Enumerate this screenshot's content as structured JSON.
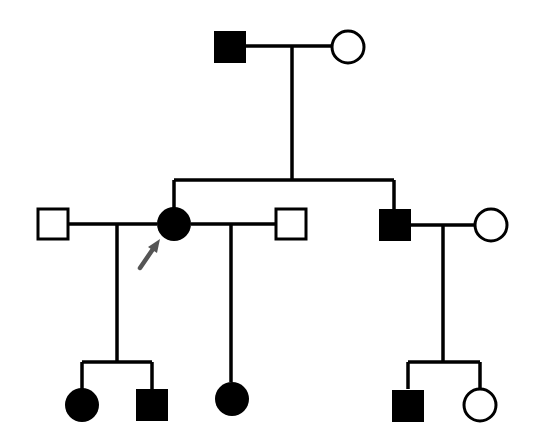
{
  "diagram": {
    "type": "pedigree",
    "colors": {
      "affected": "#000000",
      "unaffected_fill": "#ffffff",
      "line": "#000000",
      "proband_arrow": "#555555"
    },
    "generations": [
      {
        "label": "I",
        "individuals": [
          {
            "id": "I-1",
            "sex": "male",
            "affected": true
          },
          {
            "id": "I-2",
            "sex": "female",
            "affected": false
          }
        ]
      },
      {
        "label": "II",
        "individuals": [
          {
            "id": "II-1",
            "sex": "male",
            "affected": false,
            "note": "spouse 1 of proband"
          },
          {
            "id": "II-2",
            "sex": "female",
            "affected": true,
            "proband": true
          },
          {
            "id": "II-3",
            "sex": "male",
            "affected": false,
            "note": "spouse 2 of proband"
          },
          {
            "id": "II-4",
            "sex": "male",
            "affected": true
          },
          {
            "id": "II-5",
            "sex": "female",
            "affected": false,
            "note": "spouse of II-4"
          }
        ]
      },
      {
        "label": "III",
        "individuals": [
          {
            "id": "III-1",
            "sex": "female",
            "affected": true
          },
          {
            "id": "III-2",
            "sex": "male",
            "affected": true
          },
          {
            "id": "III-3",
            "sex": "female",
            "affected": true
          },
          {
            "id": "III-4",
            "sex": "male",
            "affected": true
          },
          {
            "id": "III-5",
            "sex": "female",
            "affected": false
          }
        ]
      }
    ]
  }
}
